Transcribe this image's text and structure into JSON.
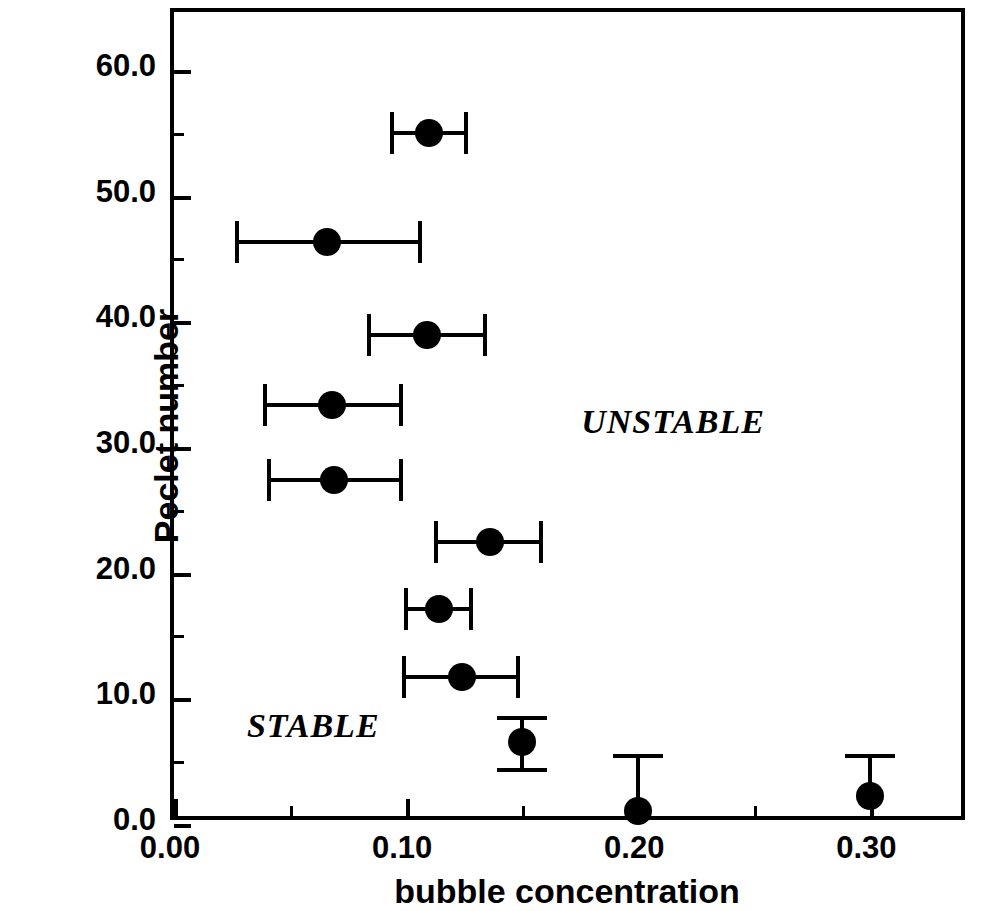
{
  "chart_data": {
    "type": "scatter",
    "title": "",
    "xlabel": "bubble concentration",
    "ylabel": "Peclet number",
    "xlim": [
      0.0,
      0.3425
    ],
    "ylim": [
      0.0,
      64.6
    ],
    "grid": false,
    "legend": "none",
    "x_ticks": [
      "0.00",
      "0.10",
      "0.20",
      "0.30"
    ],
    "x_tick_values": [
      0.0,
      0.1,
      0.2,
      0.3
    ],
    "x_minor_tick_values": [
      0.05,
      0.15,
      0.25
    ],
    "y_ticks": [
      "0.0",
      "10.0",
      "20.0",
      "30.0",
      "40.0",
      "50.0",
      "60.0"
    ],
    "y_tick_values": [
      0,
      10,
      20,
      30,
      40,
      50,
      60
    ],
    "y_minor_tick_values": [
      5,
      15,
      25,
      35,
      45,
      55
    ],
    "marker": "filled-circle",
    "marker_color": "#000000",
    "points": [
      {
        "x": 0.11,
        "y": 55.0,
        "xerr_low": 0.094,
        "xerr_high": 0.126,
        "err_dir": "horizontal"
      },
      {
        "x": 0.066,
        "y": 46.3,
        "xerr_low": 0.027,
        "xerr_high": 0.106,
        "err_dir": "horizontal"
      },
      {
        "x": 0.109,
        "y": 38.9,
        "xerr_low": 0.084,
        "xerr_high": 0.134,
        "err_dir": "horizontal"
      },
      {
        "x": 0.068,
        "y": 33.3,
        "xerr_low": 0.039,
        "xerr_high": 0.098,
        "err_dir": "horizontal"
      },
      {
        "x": 0.069,
        "y": 27.4,
        "xerr_low": 0.041,
        "xerr_high": 0.098,
        "err_dir": "horizontal"
      },
      {
        "x": 0.136,
        "y": 22.4,
        "xerr_low": 0.113,
        "xerr_high": 0.158,
        "err_dir": "horizontal"
      },
      {
        "x": 0.114,
        "y": 17.1,
        "xerr_low": 0.1,
        "xerr_high": 0.128,
        "err_dir": "horizontal"
      },
      {
        "x": 0.124,
        "y": 11.7,
        "xerr_low": 0.099,
        "xerr_high": 0.148,
        "err_dir": "horizontal"
      },
      {
        "x": 0.15,
        "y": 6.5,
        "yerr_low": 4.3,
        "yerr_high": 8.4,
        "err_dir": "vertical"
      },
      {
        "x": 0.2,
        "y": 1.0,
        "yerr_low": 1.0,
        "yerr_high": 5.4,
        "err_dir": "vertical"
      },
      {
        "x": 0.3,
        "y": 2.2,
        "yerr_low": 2.2,
        "yerr_high": 5.4,
        "err_dir": "vertical"
      }
    ],
    "annotations": [
      {
        "text": "UNSTABLE",
        "x": 0.215,
        "y": 32.0
      },
      {
        "text": "STABLE",
        "x": 0.06,
        "y": 7.8
      }
    ]
  }
}
